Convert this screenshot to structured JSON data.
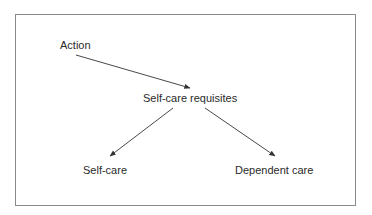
{
  "diagram": {
    "nodes": {
      "action": "Action",
      "requisites": "Self-care requisites",
      "self_care": "Self-care",
      "dependent_care": "Dependent care"
    },
    "edges": [
      {
        "from": "Action",
        "to": "Self-care requisites"
      },
      {
        "from": "Self-care requisites",
        "to": "Self-care"
      },
      {
        "from": "Self-care requisites",
        "to": "Dependent care"
      }
    ]
  }
}
